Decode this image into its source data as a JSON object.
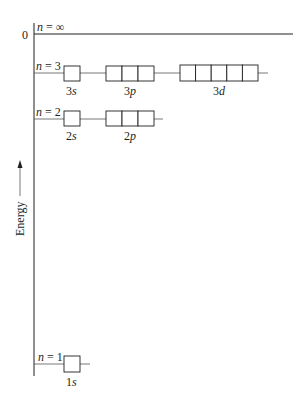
{
  "diagram": {
    "axis": {
      "label": "Energy",
      "zero_label": "0",
      "direction": "up"
    },
    "levels": [
      {
        "n_label": "n = ∞",
        "n_var": "n",
        "n_value": "∞",
        "energy": "0",
        "orbitals": []
      },
      {
        "n_label": "n = 3",
        "n_var": "n",
        "n_value": "3",
        "orbitals": [
          {
            "label": "3s",
            "num": "3",
            "letter": "s",
            "boxes": 1
          },
          {
            "label": "3p",
            "num": "3",
            "letter": "p",
            "boxes": 3
          },
          {
            "label": "3d",
            "num": "3",
            "letter": "d",
            "boxes": 5
          }
        ]
      },
      {
        "n_label": "n = 2",
        "n_var": "n",
        "n_value": "2",
        "orbitals": [
          {
            "label": "2s",
            "num": "2",
            "letter": "s",
            "boxes": 1
          },
          {
            "label": "2p",
            "num": "2",
            "letter": "p",
            "boxes": 3
          }
        ]
      },
      {
        "n_label": "n = 1",
        "n_var": "n",
        "n_value": "1",
        "orbitals": [
          {
            "label": "1s",
            "num": "1",
            "letter": "s",
            "boxes": 1
          }
        ]
      }
    ]
  }
}
